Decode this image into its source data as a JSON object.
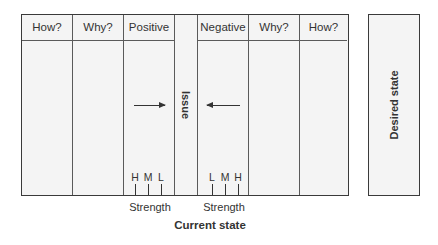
{
  "diagram": {
    "type": "force-field-analysis",
    "current_state": {
      "columns": [
        {
          "id": "how-positive",
          "header": "How?"
        },
        {
          "id": "why-positive",
          "header": "Why?"
        },
        {
          "id": "positive",
          "header": "Positive"
        },
        {
          "id": "issue",
          "header": "",
          "label": "Issue"
        },
        {
          "id": "negative",
          "header": "Negative"
        },
        {
          "id": "why-negative",
          "header": "Why?"
        },
        {
          "id": "how-negative",
          "header": "How?"
        }
      ],
      "positive_scale": [
        "H",
        "M",
        "L"
      ],
      "negative_scale": [
        "L",
        "M",
        "H"
      ],
      "positive_strength_label": "Strength",
      "negative_strength_label": "Strength",
      "caption": "Current state"
    },
    "desired_state": {
      "label": "Desired state"
    },
    "arrows": [
      {
        "from": "positive",
        "to": "issue",
        "direction": "right"
      },
      {
        "from": "negative",
        "to": "issue",
        "direction": "left"
      }
    ]
  }
}
